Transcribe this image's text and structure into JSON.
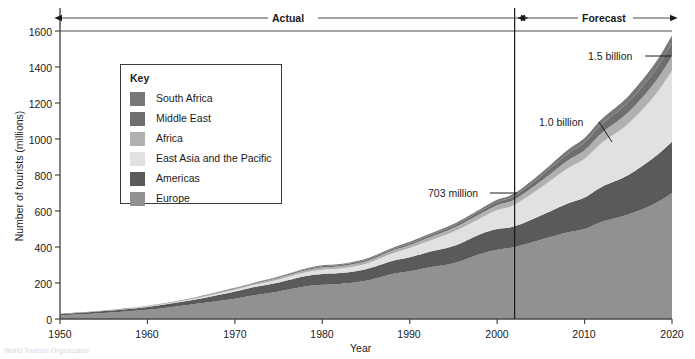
{
  "chart_data": {
    "type": "area",
    "stacked": true,
    "title": "",
    "xlabel": "Year",
    "ylabel": "Number of tourists (millions)",
    "xlim": [
      1950,
      2020
    ],
    "ylim": [
      0,
      1600
    ],
    "xticks": [
      1950,
      1960,
      1970,
      1980,
      1990,
      2000,
      2010,
      2020
    ],
    "yticks": [
      0,
      200,
      400,
      600,
      800,
      1000,
      1200,
      1400,
      1600
    ],
    "grid": false,
    "legend_position": "inside-upper-left",
    "legend_title": "Key",
    "x": [
      1950,
      1955,
      1960,
      1965,
      1970,
      1972,
      1975,
      1978,
      1980,
      1982,
      1985,
      1988,
      1990,
      1992,
      1995,
      1998,
      2000,
      2002,
      2005,
      2008,
      2010,
      2012,
      2015,
      2018,
      2020
    ],
    "series": [
      {
        "name": "Europe",
        "color": "#919191",
        "values": [
          20,
          33,
          51,
          81,
          113,
          130,
          153,
          180,
          190,
          195,
          212,
          250,
          265,
          285,
          310,
          360,
          385,
          400,
          440,
          480,
          500,
          540,
          580,
          640,
          700
        ]
      },
      {
        "name": "Americas",
        "color": "#5a5a5a",
        "values": [
          7,
          11,
          16,
          23,
          40,
          45,
          50,
          57,
          60,
          60,
          65,
          72,
          78,
          85,
          95,
          110,
          115,
          115,
          135,
          160,
          175,
          195,
          220,
          260,
          285
        ]
      },
      {
        "name": "East Asia and the Pacific",
        "color": "#e1e1e1",
        "values": [
          0.5,
          1,
          3,
          6,
          10,
          12,
          17,
          22,
          24,
          25,
          30,
          42,
          52,
          60,
          80,
          87,
          105,
          120,
          155,
          195,
          215,
          245,
          285,
          340,
          395
        ]
      },
      {
        "name": "Africa",
        "color": "#b0b0b0",
        "values": [
          0.5,
          1,
          2,
          3,
          5,
          6,
          8,
          10,
          12,
          13,
          14,
          15,
          16,
          18,
          20,
          25,
          27,
          29,
          35,
          43,
          48,
          55,
          63,
          72,
          80
        ]
      },
      {
        "name": "Middle East",
        "color": "#6e6e6e",
        "values": [
          0.2,
          0.4,
          0.8,
          1.5,
          3,
          3.5,
          5,
          6,
          7,
          7,
          8,
          9,
          10,
          11,
          13,
          15,
          18,
          20,
          28,
          36,
          42,
          48,
          56,
          64,
          70
        ]
      },
      {
        "name": "South Africa",
        "color": "#787878",
        "values": [
          0.3,
          0.5,
          0.7,
          1,
          2,
          2.5,
          3,
          4,
          5,
          5,
          6,
          7,
          8,
          9,
          10,
          12,
          13,
          14,
          17,
          22,
          25,
          29,
          34,
          40,
          45
        ]
      }
    ],
    "totals_annotated": [
      {
        "label": "703 million",
        "year": 2002,
        "value": 703
      },
      {
        "label": "1.0 billion",
        "year": 2010,
        "value": 1005
      },
      {
        "label": "1.5 billion",
        "year": 2020,
        "value": 1500
      }
    ],
    "period_divider_year": 2002,
    "period_bands": [
      {
        "label": "Actual",
        "from": 1950,
        "to": 2002
      },
      {
        "label": "Forecast",
        "from": 2002,
        "to": 2020
      }
    ]
  },
  "axes": {
    "ylabel": "Number of tourists (millions)",
    "xlabel": "Year",
    "ytick_labels": [
      "1600",
      "1400",
      "1200",
      "1000",
      "800",
      "600",
      "400",
      "200",
      "0"
    ],
    "xtick_labels": [
      "1950",
      "1960",
      "1970",
      "1980",
      "1990",
      "2000",
      "2010",
      "2020"
    ]
  },
  "legend": {
    "title": "Key",
    "items": [
      {
        "label": "South Africa",
        "color": "#787878"
      },
      {
        "label": "Middle East",
        "color": "#6e6e6e"
      },
      {
        "label": "Africa",
        "color": "#b0b0b0"
      },
      {
        "label": "East Asia and the Pacific",
        "color": "#e1e1e1"
      },
      {
        "label": "Americas",
        "color": "#5a5a5a"
      },
      {
        "label": "Europe",
        "color": "#919191"
      }
    ]
  },
  "annotations": {
    "actual": "Actual",
    "forecast": "Forecast",
    "callout_703": "703 million",
    "callout_10b": "1.0 billion",
    "callout_15b": "1.5 billion"
  },
  "footnote": "World Tourism Organization"
}
